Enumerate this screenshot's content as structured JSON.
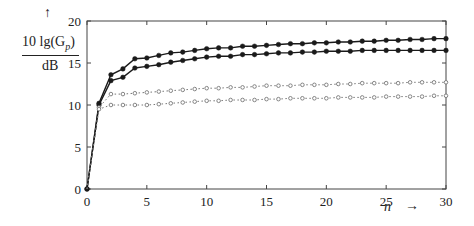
{
  "chart_data": {
    "type": "line",
    "title": "",
    "xlabel": "n",
    "ylabel": "10lg(G_p) / dB",
    "xlim": [
      0,
      30
    ],
    "ylim": [
      0,
      20
    ],
    "x_ticks": [
      0,
      5,
      10,
      15,
      20,
      25,
      30
    ],
    "y_ticks": [
      0,
      5,
      10,
      15,
      20
    ],
    "grid": false,
    "legend": null,
    "x": [
      0,
      1,
      2,
      3,
      4,
      5,
      6,
      7,
      8,
      9,
      10,
      11,
      12,
      13,
      14,
      15,
      16,
      17,
      18,
      19,
      20,
      21,
      22,
      23,
      24,
      25,
      26,
      27,
      28,
      29,
      30
    ],
    "series": [
      {
        "name": "solid-upper",
        "style": "solid",
        "marker": "filled-circle",
        "values": [
          0,
          10.2,
          13.6,
          14.3,
          15.5,
          15.6,
          15.9,
          16.2,
          16.3,
          16.5,
          16.7,
          16.8,
          16.8,
          17.0,
          17.0,
          17.1,
          17.2,
          17.3,
          17.3,
          17.4,
          17.4,
          17.5,
          17.5,
          17.6,
          17.6,
          17.7,
          17.7,
          17.8,
          17.8,
          17.9,
          17.9
        ]
      },
      {
        "name": "solid-lower",
        "style": "solid",
        "marker": "filled-circle",
        "values": [
          0,
          10.0,
          12.9,
          13.3,
          14.4,
          14.6,
          14.8,
          15.1,
          15.3,
          15.5,
          15.7,
          15.8,
          15.8,
          16.0,
          16.0,
          16.1,
          16.2,
          16.2,
          16.3,
          16.3,
          16.4,
          16.4,
          16.4,
          16.5,
          16.5,
          16.5,
          16.5,
          16.5,
          16.5,
          16.5,
          16.5
        ]
      },
      {
        "name": "dotted-upper",
        "style": "dotted",
        "marker": "open-circle",
        "values": [
          0,
          9.7,
          11.3,
          11.3,
          11.4,
          11.5,
          11.6,
          11.7,
          11.8,
          11.9,
          12.0,
          12.0,
          12.1,
          12.1,
          12.2,
          12.3,
          12.3,
          12.3,
          12.4,
          12.4,
          12.4,
          12.5,
          12.5,
          12.6,
          12.6,
          12.6,
          12.6,
          12.7,
          12.7,
          12.7,
          12.7
        ]
      },
      {
        "name": "dotted-lower",
        "style": "dotted",
        "marker": "open-circle",
        "values": [
          0,
          9.5,
          10.0,
          10.0,
          10.0,
          10.0,
          10.1,
          10.2,
          10.3,
          10.4,
          10.5,
          10.5,
          10.6,
          10.6,
          10.6,
          10.7,
          10.7,
          10.8,
          10.8,
          10.8,
          10.8,
          10.9,
          10.9,
          10.9,
          10.9,
          11.0,
          11.0,
          11.0,
          11.0,
          11.1,
          11.1
        ]
      }
    ]
  },
  "labels": {
    "y_top": "10 lg(G",
    "y_sub": "p",
    "y_close": ")",
    "y_unit": "dB",
    "y_arrow": "↑",
    "x_name": "n",
    "x_arrow": "→"
  },
  "colors": {
    "line": "#1a1a1a",
    "dotted": "#777777",
    "axis": "#444444"
  }
}
